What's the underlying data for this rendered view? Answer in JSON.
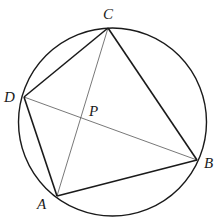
{
  "diagram": {
    "circle": {
      "cx": 112.5,
      "cy": 122,
      "r": 94
    },
    "points": {
      "A": {
        "x": 57,
        "y": 196,
        "label": "A",
        "lx": 37,
        "ly": 209
      },
      "B": {
        "x": 197,
        "y": 160,
        "label": "B",
        "lx": 204,
        "ly": 168
      },
      "C": {
        "x": 108,
        "y": 28,
        "label": "C",
        "lx": 103,
        "ly": 19
      },
      "D": {
        "x": 24,
        "y": 97,
        "label": "D",
        "lx": 4,
        "ly": 102
      },
      "P": {
        "x": 81,
        "y": 118,
        "label": "P",
        "lx": 89,
        "ly": 116
      }
    },
    "sides": [
      "AB",
      "BC",
      "CD",
      "DA"
    ],
    "diagonals": [
      "AC",
      "BD"
    ],
    "colors": {
      "stroke": "#1a1a1a",
      "diagonal": "#555555"
    }
  }
}
